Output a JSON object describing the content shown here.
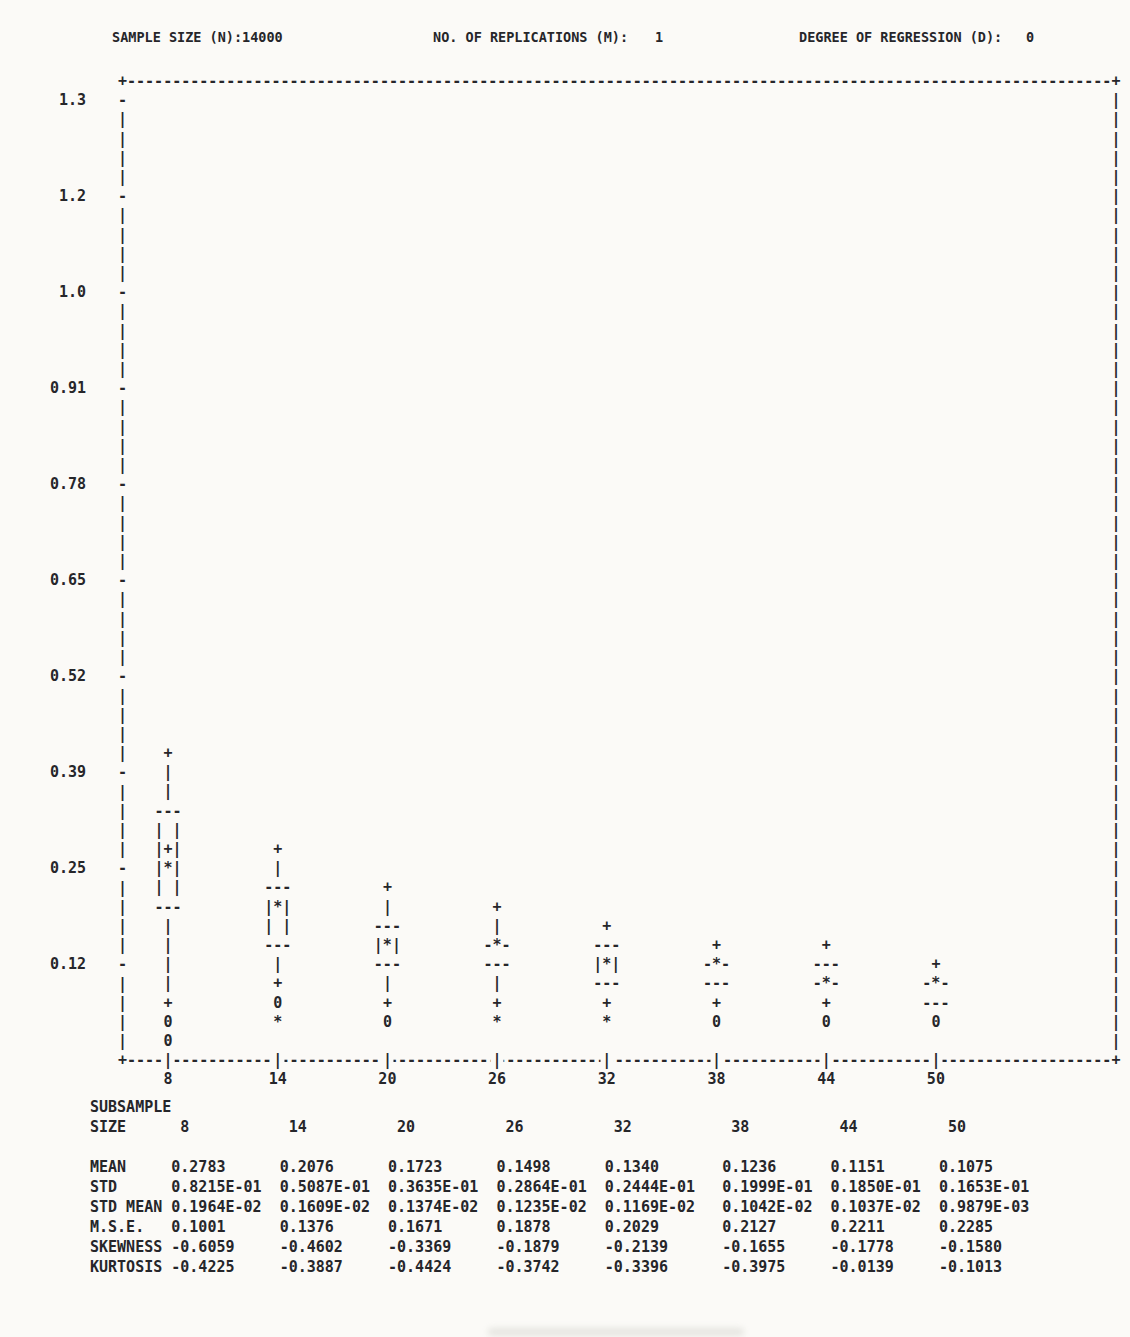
{
  "page": {
    "colors": {
      "paper": "#fbfaf7",
      "ink": "#26262a"
    }
  },
  "header": {
    "fields": [
      {
        "label": "SAMPLE SIZE (N):",
        "value": "14000"
      },
      {
        "label": "NO. OF REPLICATIONS (M):",
        "value": "1"
      },
      {
        "label": "DEGREE OF REGRESSION (D):",
        "value": "0"
      }
    ]
  },
  "plot": {
    "y_ticks": [
      "1.3",
      "1.2",
      "1.0",
      "0.91",
      "0.78",
      "0.65",
      "0.52",
      "0.39",
      "0.25",
      "0.12"
    ],
    "columns": [
      {
        "x": "8",
        "markers": [
          [
            35,
            "+"
          ],
          [
            36,
            "|"
          ],
          [
            37,
            "|"
          ],
          [
            38,
            "---"
          ],
          [
            39,
            "| |"
          ],
          [
            40,
            "|+|"
          ],
          [
            41,
            "|*|"
          ],
          [
            42,
            "| |"
          ],
          [
            43,
            "---"
          ],
          [
            44,
            "|"
          ],
          [
            45,
            "|"
          ],
          [
            46,
            "|"
          ],
          [
            47,
            "|"
          ],
          [
            48,
            "+"
          ],
          [
            49,
            "0"
          ],
          [
            50,
            "0"
          ]
        ]
      },
      {
        "x": "14",
        "markers": [
          [
            40,
            "+"
          ],
          [
            41,
            "|"
          ],
          [
            42,
            "---"
          ],
          [
            43,
            "|*|"
          ],
          [
            44,
            "| |"
          ],
          [
            45,
            "---"
          ],
          [
            46,
            "|"
          ],
          [
            47,
            "+"
          ],
          [
            48,
            "0"
          ],
          [
            49,
            "*"
          ]
        ]
      },
      {
        "x": "20",
        "markers": [
          [
            42,
            "+"
          ],
          [
            43,
            "|"
          ],
          [
            44,
            "---"
          ],
          [
            45,
            "|*|"
          ],
          [
            46,
            "---"
          ],
          [
            47,
            "|"
          ],
          [
            48,
            "+"
          ],
          [
            49,
            "0"
          ]
        ]
      },
      {
        "x": "26",
        "markers": [
          [
            43,
            "+"
          ],
          [
            44,
            "|"
          ],
          [
            45,
            "-*-"
          ],
          [
            46,
            "---"
          ],
          [
            47,
            "|"
          ],
          [
            48,
            "+"
          ],
          [
            49,
            "*"
          ]
        ]
      },
      {
        "x": "32",
        "markers": [
          [
            44,
            "+"
          ],
          [
            45,
            "---"
          ],
          [
            46,
            "|*|"
          ],
          [
            47,
            "---"
          ],
          [
            48,
            "+"
          ],
          [
            49,
            "*"
          ]
        ]
      },
      {
        "x": "38",
        "markers": [
          [
            45,
            "+"
          ],
          [
            46,
            "-*-"
          ],
          [
            47,
            "---"
          ],
          [
            48,
            "+"
          ],
          [
            49,
            "0"
          ]
        ]
      },
      {
        "x": "44",
        "markers": [
          [
            45,
            "+"
          ],
          [
            46,
            "---"
          ],
          [
            47,
            "-*-"
          ],
          [
            48,
            "+"
          ],
          [
            49,
            "0"
          ]
        ]
      },
      {
        "x": "50",
        "markers": [
          [
            46,
            "+"
          ],
          [
            47,
            "-*-"
          ],
          [
            48,
            "---"
          ],
          [
            49,
            "0"
          ]
        ]
      }
    ]
  },
  "table": {
    "title": "SUBSAMPLE",
    "size_label": "SIZE",
    "col_headers": [
      "8",
      "14",
      "20",
      "26",
      "32",
      "38",
      "44",
      "50"
    ],
    "rows": [
      {
        "label": "MEAN",
        "values": [
          "0.2783",
          "0.2076",
          "0.1723",
          "0.1498",
          "0.1340",
          "0.1236",
          "0.1151",
          "0.1075"
        ]
      },
      {
        "label": "STD",
        "values": [
          "0.8215E-01",
          "0.5087E-01",
          "0.3635E-01",
          "0.2864E-01",
          "0.2444E-01",
          "0.1999E-01",
          "0.1850E-01",
          "0.1653E-01"
        ]
      },
      {
        "label": "STD MEAN",
        "values": [
          "0.1964E-02",
          "0.1609E-02",
          "0.1374E-02",
          "0.1235E-02",
          "0.1169E-02",
          "0.1042E-02",
          "0.1037E-02",
          "0.9879E-03"
        ]
      },
      {
        "label": "M.S.E.",
        "values": [
          "0.1001",
          "0.1376",
          "0.1671",
          "0.1878",
          "0.2029",
          "0.2127",
          "0.2211",
          "0.2285"
        ]
      },
      {
        "label": "SKEWNESS",
        "values": [
          "-0.6059",
          "-0.4602",
          "-0.3369",
          "-0.1879",
          "-0.2139",
          "-0.1655",
          "-0.1778",
          "-0.1580"
        ]
      },
      {
        "label": "KURTOSIS",
        "values": [
          "-0.4225",
          "-0.3887",
          "-0.4424",
          "-0.3742",
          "-0.3396",
          "-0.3975",
          "-0.0139",
          "-0.1013"
        ]
      }
    ]
  },
  "chart_data": {
    "type": "boxplot",
    "title": "",
    "xlabel": "SUBSAMPLE SIZE",
    "ylabel": "",
    "x": [
      8,
      14,
      20,
      26,
      32,
      38,
      44,
      50
    ],
    "y_tick_labels": [
      "1.3",
      "1.2",
      "1.0",
      "0.91",
      "0.78",
      "0.65",
      "0.52",
      "0.39",
      "0.25",
      "0.12"
    ],
    "ylim": [
      0,
      1.35
    ],
    "grid": false,
    "legend_position": "none",
    "boxes": [
      {
        "x": 8,
        "upper_adjacent": 0.416,
        "q3": 0.338,
        "mean": 0.286,
        "median": 0.26,
        "q1": 0.208,
        "lower_adjacent": 0.078,
        "outliers": [
          0.052,
          0.026
        ]
      },
      {
        "x": 14,
        "upper_adjacent": 0.286,
        "q3": 0.234,
        "median": 0.208,
        "q1": 0.156,
        "lower_adjacent": 0.104,
        "outliers": [
          0.078,
          0.052
        ]
      },
      {
        "x": 20,
        "upper_adjacent": 0.234,
        "q3": 0.182,
        "median": 0.156,
        "q1": 0.13,
        "lower_adjacent": 0.078,
        "outliers": [
          0.052
        ]
      },
      {
        "x": 26,
        "upper_adjacent": 0.208,
        "q3": 0.156,
        "median": 0.156,
        "q1": 0.13,
        "lower_adjacent": 0.078,
        "outliers": [
          0.052
        ]
      },
      {
        "x": 32,
        "upper_adjacent": 0.182,
        "q3": 0.156,
        "median": 0.13,
        "q1": 0.104,
        "lower_adjacent": 0.078,
        "outliers": [
          0.052
        ]
      },
      {
        "x": 38,
        "upper_adjacent": 0.156,
        "q3": 0.13,
        "median": 0.13,
        "q1": 0.104,
        "lower_adjacent": 0.078,
        "outliers": [
          0.052
        ]
      },
      {
        "x": 44,
        "upper_adjacent": 0.156,
        "q3": 0.13,
        "median": 0.104,
        "q1": 0.104,
        "lower_adjacent": 0.078,
        "outliers": [
          0.052
        ]
      },
      {
        "x": 50,
        "upper_adjacent": 0.13,
        "q3": 0.104,
        "median": 0.104,
        "q1": 0.078,
        "lower_adjacent": null,
        "outliers": [
          0.052
        ]
      }
    ],
    "series": [
      {
        "name": "MEAN",
        "values": [
          0.2783,
          0.2076,
          0.1723,
          0.1498,
          0.134,
          0.1236,
          0.1151,
          0.1075
        ]
      },
      {
        "name": "STD",
        "values": [
          0.08215,
          0.05087,
          0.03635,
          0.02864,
          0.02444,
          0.01999,
          0.0185,
          0.01653
        ]
      },
      {
        "name": "STD MEAN",
        "values": [
          0.001964,
          0.001609,
          0.001374,
          0.001235,
          0.001169,
          0.001042,
          0.001037,
          0.0009879
        ]
      },
      {
        "name": "M.S.E.",
        "values": [
          0.1001,
          0.1376,
          0.1671,
          0.1878,
          0.2029,
          0.2127,
          0.2211,
          0.2285
        ]
      },
      {
        "name": "SKEWNESS",
        "values": [
          -0.6059,
          -0.4602,
          -0.3369,
          -0.1879,
          -0.2139,
          -0.1655,
          -0.1778,
          -0.158
        ]
      },
      {
        "name": "KURTOSIS",
        "values": [
          -0.4225,
          -0.3887,
          -0.4424,
          -0.3742,
          -0.3396,
          -0.3975,
          -0.0139,
          -0.1013
        ]
      }
    ]
  }
}
